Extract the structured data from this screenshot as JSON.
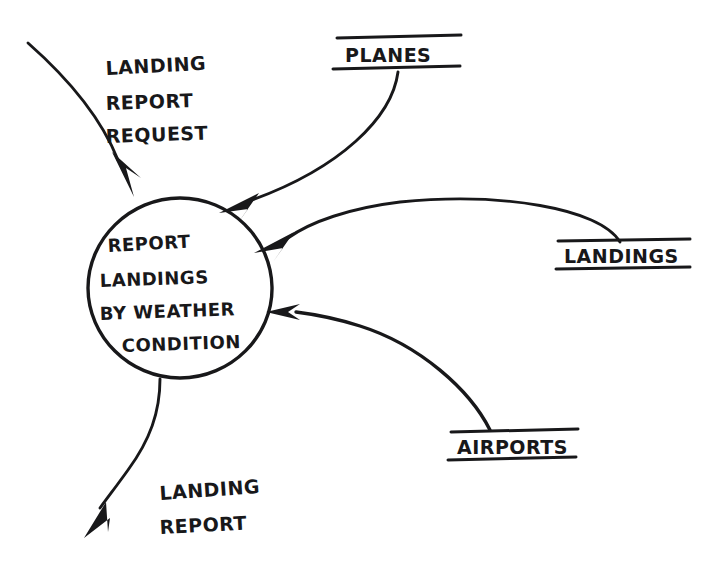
{
  "diagram": {
    "type": "data-flow-diagram",
    "style": "hand-drawn",
    "title": "Report Landings By Weather Condition",
    "ink_color": "#18181a",
    "background_color": "#ffffff",
    "process": {
      "shape": "circle",
      "lines": [
        "REPORT",
        "LANDINGS",
        "BY WEATHER",
        "CONDITION"
      ],
      "line1": "REPORT",
      "line2": "LANDINGS",
      "line3": "BY WEATHER",
      "line4": "CONDITION"
    },
    "data_stores": [
      {
        "id": "planes",
        "label": "PLANES"
      },
      {
        "id": "landings",
        "label": "LANDINGS"
      },
      {
        "id": "airports",
        "label": "AIRPORTS"
      }
    ],
    "stores": {
      "planes": "PLANES",
      "landings": "LANDINGS",
      "airports": "AIRPORTS"
    },
    "flows": [
      {
        "id": "landing-report-request",
        "direction": "in",
        "source": "external",
        "target": "process",
        "lines": [
          "LANDING",
          "REPORT",
          "REQUEST"
        ]
      },
      {
        "id": "planes-flow",
        "direction": "in",
        "source": "planes",
        "target": "process",
        "lines": []
      },
      {
        "id": "landings-flow",
        "direction": "in",
        "source": "landings",
        "target": "process",
        "lines": []
      },
      {
        "id": "airports-flow",
        "direction": "in",
        "source": "airports",
        "target": "process",
        "lines": []
      },
      {
        "id": "landing-report",
        "direction": "out",
        "source": "process",
        "target": "external",
        "lines": [
          "LANDING",
          "REPORT"
        ]
      }
    ],
    "flow_labels": {
      "request_line1": "LANDING",
      "request_line2": "REPORT",
      "request_line3": "REQUEST",
      "report_line1": "LANDING",
      "report_line2": "REPORT"
    }
  }
}
